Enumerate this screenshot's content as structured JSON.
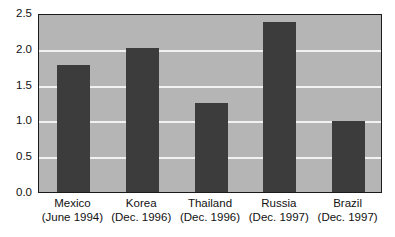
{
  "chart_data": {
    "type": "bar",
    "title": "",
    "subtitle": "",
    "xlabel": "",
    "ylabel": "",
    "categories": [
      "Mexico",
      "Korea",
      "Thailand",
      "Russia",
      "Brazil"
    ],
    "category_sublabels": [
      "(June 1994)",
      "(Dec. 1996)",
      "(Dec. 1996)",
      "(Dec. 1997)",
      "(Dec. 1997)"
    ],
    "values": [
      1.78,
      2.01,
      1.25,
      2.38,
      0.99
    ],
    "ylim": [
      0.0,
      2.5
    ],
    "ytick_labels": [
      "0.0",
      "0.5",
      "1.0",
      "1.5",
      "2.0",
      "2.5"
    ],
    "ytick_values": [
      0.0,
      0.5,
      1.0,
      1.5,
      2.0,
      2.5
    ],
    "grid": true,
    "grid_orientation": "horizontal",
    "legend": false,
    "legend_position": "none",
    "annotations": [],
    "colors": {
      "bar": "#3c3c3c",
      "plot_background": "#b5b5b5",
      "gridline": "#f2f2f2",
      "axis_text": "#111111",
      "frame": "#1a1a1a",
      "figure_background": "#ffffff"
    }
  }
}
